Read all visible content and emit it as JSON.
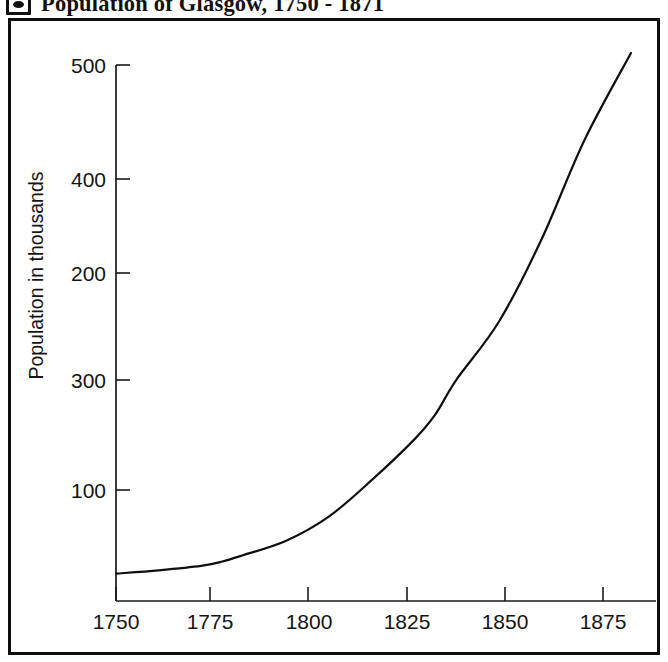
{
  "header": {
    "badge_icon": "circle-in-square-icon",
    "title": "Population of Glasgow, 1750 - 1871"
  },
  "chart_data": {
    "type": "line",
    "title": "Population of Glasgow, 1750 - 1871",
    "xlabel": "",
    "ylabel": "Population in thousands",
    "grid": false,
    "legend": false,
    "xlim": [
      1750,
      1875
    ],
    "ylim": [
      0,
      500
    ],
    "xtick_labels": [
      "1750",
      "1775",
      "1800",
      "1825",
      "1850",
      "1875"
    ],
    "xticks": [
      1750,
      1775,
      1800,
      1825,
      1850,
      1875
    ],
    "ytick_labels": [
      "500",
      "400",
      "200",
      "300",
      "100"
    ],
    "ytick_positions_top_to_bottom": [
      500,
      400,
      300,
      200,
      100
    ],
    "series": [
      {
        "name": "Population of Glasgow",
        "x": [
          1750,
          1760,
          1770,
          1775,
          1780,
          1790,
          1800,
          1810,
          1820,
          1825,
          1830,
          1840,
          1850,
          1860,
          1871
        ],
        "values": [
          25,
          28,
          32,
          36,
          42,
          55,
          77,
          110,
          147,
          170,
          202,
          255,
          330,
          420,
          500
        ]
      }
    ]
  },
  "yaxis": {
    "label": "Population in thousands",
    "ticks": [
      {
        "label": "500",
        "y": 62
      },
      {
        "label": "400",
        "y": 176
      },
      {
        "label": "200",
        "y": 270
      },
      {
        "label": "300",
        "y": 377
      },
      {
        "label": "100",
        "y": 487
      }
    ]
  },
  "xaxis": {
    "ticks": [
      {
        "label": "1750",
        "x": 113
      },
      {
        "label": "1775",
        "x": 207
      },
      {
        "label": "1800",
        "x": 306
      },
      {
        "label": "1825",
        "x": 404
      },
      {
        "label": "1850",
        "x": 502
      },
      {
        "label": "1875",
        "x": 600
      }
    ]
  },
  "colors": {
    "frame": "#0d0d0d",
    "axis": "#1a1a1a",
    "curve": "#0f0f0f",
    "text": "#141414",
    "background": "#ffffff"
  }
}
